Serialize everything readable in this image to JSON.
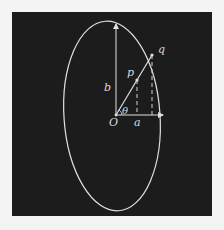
{
  "diagram": {
    "colors": {
      "background": "#f4f4f4",
      "panel": "#1c1c1c",
      "stroke": "#e0e0e0",
      "label": "#d8d8d8"
    },
    "labels": {
      "origin": "O",
      "semi_major": "b",
      "semi_minor": "a",
      "point_p": "p",
      "point_q": "q",
      "angle": "θ"
    },
    "elements": {
      "ellipse": "ellipse-outline",
      "axis_b": "vertical arrow from O to top of ellipse",
      "axis_a": "horizontal arrow from O to right of ellipse",
      "ray": "line from O through p to q on ellipse",
      "projections": "dashed vertical lines from p and q down to axis a"
    }
  }
}
